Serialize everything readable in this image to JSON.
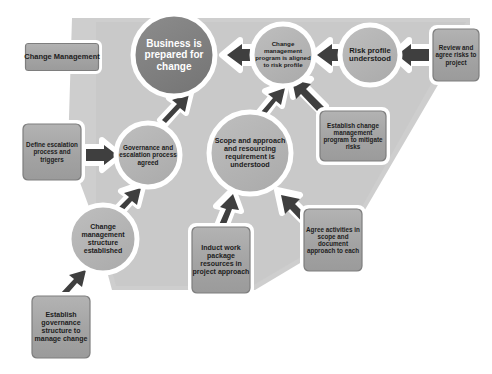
{
  "diagram": {
    "colors": {
      "background": "#ffffff",
      "band": "#cccccc",
      "band_edge": "#c2c2c2",
      "circle_fill": "#b5b5b5",
      "circle_stroke": "#ffffff",
      "goal_fill": "#7f7f7f",
      "goal_stroke": "#ffffff",
      "box_fill": "#a6a6a6",
      "box_border": "#8a8a8a",
      "box_halo": "#ffffff",
      "arrow": "#3f3f3f",
      "arrow_outline": "#ffffff",
      "text_dark": "#1d1d1d",
      "text_light": "#ffffff"
    },
    "legend": {
      "label": "Change Management"
    },
    "goal": {
      "label": "Business is prepared for change"
    },
    "outcomes": [
      {
        "id": "change-program-aligned",
        "label": "Change management program is aligned to risk profile"
      },
      {
        "id": "risk-profile-understood",
        "label": "Risk profile understood"
      },
      {
        "id": "governance-escalation-agreed",
        "label": "Governance and escalation process agreed"
      },
      {
        "id": "scope-approach-understood",
        "label": "Scope and approach and resourcing requirement is understood"
      },
      {
        "id": "change-structure-established",
        "label": "Change management structure established"
      }
    ],
    "activities": [
      {
        "id": "review-agree-risks",
        "label": "Review and agree risks to project"
      },
      {
        "id": "establish-change-program",
        "label": "Establish change management program to mitigate risks"
      },
      {
        "id": "define-escalation-process",
        "label": "Define escalation process and triggers"
      },
      {
        "id": "agree-activities-in-scope",
        "label": "Agree activities in scope and document approach to each"
      },
      {
        "id": "induct-work-package",
        "label": "Induct work package resources in project approach"
      },
      {
        "id": "establish-governance-structure",
        "label": "Establish governance structure to manage change"
      }
    ],
    "connections": [
      {
        "from": "review-agree-risks",
        "to": "risk-profile-understood"
      },
      {
        "from": "risk-profile-understood",
        "to": "change-program-aligned"
      },
      {
        "from": "change-program-aligned",
        "to": "business-prepared-for-change"
      },
      {
        "from": "establish-change-program",
        "to": "change-program-aligned"
      },
      {
        "from": "scope-approach-understood",
        "to": "change-program-aligned"
      },
      {
        "from": "governance-escalation-agreed",
        "to": "business-prepared-for-change"
      },
      {
        "from": "define-escalation-process",
        "to": "governance-escalation-agreed"
      },
      {
        "from": "change-structure-established",
        "to": "governance-escalation-agreed"
      },
      {
        "from": "establish-governance-structure",
        "to": "change-structure-established"
      },
      {
        "from": "induct-work-package",
        "to": "scope-approach-understood"
      },
      {
        "from": "agree-activities-in-scope",
        "to": "scope-approach-understood"
      }
    ]
  }
}
